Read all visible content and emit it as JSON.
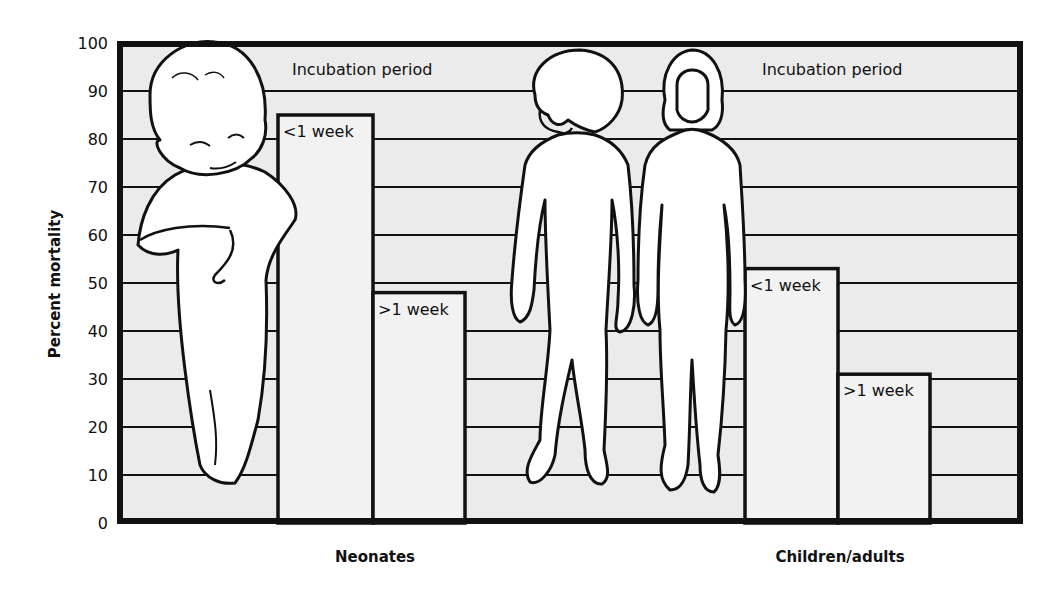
{
  "chart_data": {
    "type": "bar",
    "title": "",
    "xlabel": "",
    "ylabel": "Percent mortality",
    "ylim": [
      0,
      100
    ],
    "yticks": [
      0,
      10,
      20,
      30,
      40,
      50,
      60,
      70,
      80,
      90,
      100
    ],
    "grid": true,
    "groups": [
      "Neonates",
      "Children/adults"
    ],
    "group_annotation": "Incubation period",
    "series": [
      {
        "name": "<1 week",
        "values": [
          85,
          53
        ]
      },
      {
        "name": ">1 week",
        "values": [
          48,
          31
        ]
      }
    ],
    "bars": [
      {
        "group": "Neonates",
        "label": "<1 week",
        "value": 85
      },
      {
        "group": "Neonates",
        "label": ">1 week",
        "value": 48
      },
      {
        "group": "Children/adults",
        "label": "<1 week",
        "value": 53
      },
      {
        "group": "Children/adults",
        "label": ">1 week",
        "value": 31
      }
    ],
    "illustrations": [
      "neonate-figure",
      "child-figure",
      "adult-figure"
    ],
    "legend": "none"
  },
  "labels": {
    "ylabel": "Percent mortality",
    "annot_left": "Incubation period",
    "annot_right": "Incubation period",
    "group_left": "Neonates",
    "group_right": "Children/adults"
  },
  "colors": {
    "plot_bg": "#ebebeb",
    "bar_fill": "#f2f2f2",
    "stroke": "#111111",
    "figure_fill": "#ffffff"
  }
}
